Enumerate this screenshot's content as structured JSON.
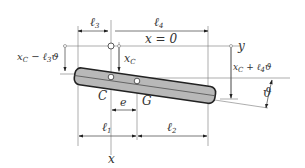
{
  "diagram": {
    "labels": {
      "l3": "ℓ",
      "l3_sub": "3",
      "l4": "ℓ",
      "l4_sub": "4",
      "x_eq": "x = 0",
      "y_axis": "y",
      "xc_minus": "x",
      "xc_minus_sub": "C",
      "xc_minus_rest": " − ℓ",
      "xc_minus_sub2": "3",
      "xc_minus_end": "ϑ",
      "xc": "x",
      "xc_sub": "C",
      "xc_plus": "x",
      "xc_plus_sub": "C",
      "xc_plus_rest": " + ℓ",
      "xc_plus_sub2": "4",
      "xc_plus_end": "ϑ",
      "theta": "ϑ",
      "C": "C",
      "G": "G",
      "e": "e",
      "l1": "ℓ",
      "l1_sub": "1",
      "l2": "ℓ",
      "l2_sub": "2",
      "x_axis": "x"
    },
    "colors": {
      "bar_fill": "#b8b8b8",
      "bar_stroke": "#222222",
      "lines": "#555555",
      "text": "#333333"
    }
  }
}
